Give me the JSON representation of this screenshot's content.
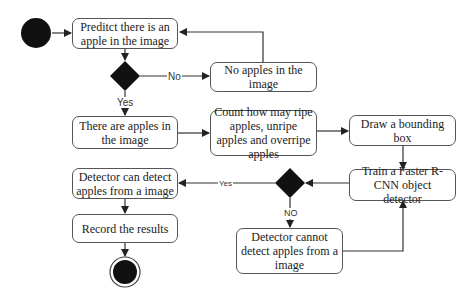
{
  "diagram": {
    "type": "activity-flowchart",
    "nodes": {
      "start": {
        "kind": "initial"
      },
      "predict": {
        "label": "Preditct there is an apple in the image"
      },
      "decision1": {
        "kind": "decision"
      },
      "no_apples": {
        "label": "No apples in the image"
      },
      "there_are_apples": {
        "label": "There are apples in the image"
      },
      "count": {
        "label": "Count how may ripe apples, unripe apples and overripe apples"
      },
      "bounding_box": {
        "label": "Draw a bounding box"
      },
      "train": {
        "label": "Train a Faster R-CNN object detector"
      },
      "decision2": {
        "kind": "decision"
      },
      "can_detect": {
        "label": "Detector can detect apples from a image"
      },
      "cannot_detect": {
        "label": "Detector cannot detect apples from a image"
      },
      "record": {
        "label": "Record the results"
      },
      "end": {
        "kind": "final"
      }
    },
    "edge_labels": {
      "d1_no": "No",
      "d1_yes": "Yes",
      "d2_yes": "Yes",
      "d2_no": "NO"
    },
    "edges": [
      [
        "start",
        "predict"
      ],
      [
        "predict",
        "decision1"
      ],
      [
        "decision1",
        "no_apples",
        "No"
      ],
      [
        "no_apples",
        "predict"
      ],
      [
        "decision1",
        "there_are_apples",
        "Yes"
      ],
      [
        "there_are_apples",
        "count"
      ],
      [
        "count",
        "bounding_box"
      ],
      [
        "bounding_box",
        "train"
      ],
      [
        "train",
        "decision2"
      ],
      [
        "decision2",
        "can_detect",
        "Yes"
      ],
      [
        "decision2",
        "cannot_detect",
        "NO"
      ],
      [
        "cannot_detect",
        "train"
      ],
      [
        "can_detect",
        "record"
      ],
      [
        "record",
        "end"
      ]
    ]
  }
}
